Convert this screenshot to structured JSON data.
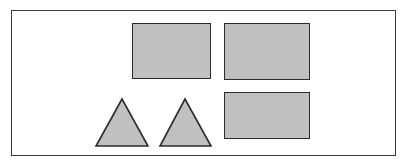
{
  "figure": {
    "background_color": "#ffffff",
    "frame": {
      "name": "outer-frame",
      "border_color": "#3a3a3a",
      "fill_color": "#ffffff",
      "x": 11,
      "y": 10,
      "width": 385,
      "height": 146
    },
    "shape_style": {
      "fill_color": "#c0c0c0",
      "stroke_color": "#2b2b2b",
      "stroke_width": 1.5
    },
    "shapes": [
      {
        "id": "rect-top-left",
        "type": "rectangle",
        "label": "",
        "x": 132,
        "y": 23,
        "width": 79,
        "height": 56,
        "fill_color": "#c0c0c0",
        "stroke_color": "#2b2b2b"
      },
      {
        "id": "rect-top-right",
        "type": "rectangle",
        "label": "",
        "x": 224,
        "y": 23,
        "width": 86,
        "height": 57,
        "fill_color": "#c0c0c0",
        "stroke_color": "#2b2b2b"
      },
      {
        "id": "rect-bottom-right",
        "type": "rectangle",
        "label": "",
        "x": 224,
        "y": 92,
        "width": 86,
        "height": 47,
        "fill_color": "#c0c0c0",
        "stroke_color": "#2b2b2b"
      },
      {
        "id": "triangle-left",
        "type": "triangle",
        "label": "",
        "apex_x": 122,
        "apex_y": 99,
        "base_left_x": 96,
        "base_right_x": 147,
        "base_y": 146,
        "points": "30,4 4,51 56,51",
        "fill_color": "#c0c0c0",
        "stroke_color": "#2b2b2b"
      },
      {
        "id": "triangle-right",
        "type": "triangle",
        "label": "",
        "apex_x": 185,
        "apex_y": 99,
        "base_left_x": 160,
        "base_right_x": 210,
        "base_y": 146,
        "points": "29,4 4,51 55,51",
        "fill_color": "#c0c0c0",
        "stroke_color": "#2b2b2b"
      }
    ],
    "counts": {
      "rectangles": 3,
      "triangles": 2,
      "total": 5
    }
  }
}
